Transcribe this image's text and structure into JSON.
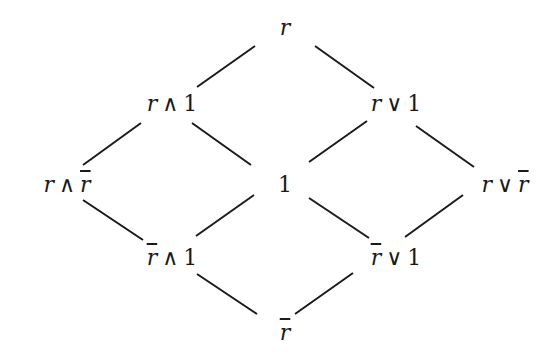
{
  "diagram": {
    "type": "hasse-lattice",
    "nodes": [
      {
        "id": "top",
        "label": "r",
        "parts": {
          "a": "r",
          "a_bar": false,
          "op": "",
          "b": "",
          "b_bar": false
        },
        "x": 285,
        "y": 28
      },
      {
        "id": "r_and_1",
        "label": "r ∧ 1",
        "parts": {
          "a": "r",
          "a_bar": false,
          "op": "∧",
          "b": "1",
          "b_bar": false
        },
        "x": 172,
        "y": 104
      },
      {
        "id": "r_or_1",
        "label": "r ∨ 1",
        "parts": {
          "a": "r",
          "a_bar": false,
          "op": "∨",
          "b": "1",
          "b_bar": false
        },
        "x": 396,
        "y": 104
      },
      {
        "id": "r_and_rbar",
        "label": "r ∧ r̄",
        "parts": {
          "a": "r",
          "a_bar": false,
          "op": "∧",
          "b": "r",
          "b_bar": true
        },
        "x": 67,
        "y": 185
      },
      {
        "id": "one",
        "label": "1",
        "parts": {
          "a": "1",
          "a_bar": false,
          "op": "",
          "b": "",
          "b_bar": false
        },
        "x": 285,
        "y": 185
      },
      {
        "id": "r_or_rbar",
        "label": "r ∨ r̄",
        "parts": {
          "a": "r",
          "a_bar": false,
          "op": "∨",
          "b": "r",
          "b_bar": true
        },
        "x": 505,
        "y": 185
      },
      {
        "id": "rbar_and_1",
        "label": "r̄ ∧ 1",
        "parts": {
          "a": "r",
          "a_bar": true,
          "op": "∧",
          "b": "1",
          "b_bar": false
        },
        "x": 172,
        "y": 258
      },
      {
        "id": "rbar_or_1",
        "label": "r̄ ∨ 1",
        "parts": {
          "a": "r",
          "a_bar": true,
          "op": "∨",
          "b": "1",
          "b_bar": false
        },
        "x": 396,
        "y": 258
      },
      {
        "id": "bottom",
        "label": "r̄",
        "parts": {
          "a": "r",
          "a_bar": true,
          "op": "",
          "b": "",
          "b_bar": false
        },
        "x": 285,
        "y": 333
      }
    ],
    "edges": [
      {
        "from": "top",
        "to": "r_and_1",
        "x1": 255,
        "y1": 46,
        "x2": 197,
        "y2": 87
      },
      {
        "from": "top",
        "to": "r_or_1",
        "x1": 315,
        "y1": 46,
        "x2": 374,
        "y2": 88
      },
      {
        "from": "r_and_1",
        "to": "r_and_rbar",
        "x1": 141,
        "y1": 123,
        "x2": 83,
        "y2": 165
      },
      {
        "from": "r_and_1",
        "to": "one",
        "x1": 192,
        "y1": 123,
        "x2": 251,
        "y2": 165
      },
      {
        "from": "r_or_1",
        "to": "one",
        "x1": 367,
        "y1": 121,
        "x2": 309,
        "y2": 162
      },
      {
        "from": "r_or_1",
        "to": "r_or_rbar",
        "x1": 416,
        "y1": 126,
        "x2": 474,
        "y2": 167
      },
      {
        "from": "r_and_rbar",
        "to": "rbar_and_1",
        "x1": 83,
        "y1": 200,
        "x2": 143,
        "y2": 240
      },
      {
        "from": "one",
        "to": "rbar_and_1",
        "x1": 254,
        "y1": 195,
        "x2": 196,
        "y2": 236
      },
      {
        "from": "one",
        "to": "rbar_or_1",
        "x1": 309,
        "y1": 198,
        "x2": 369,
        "y2": 238
      },
      {
        "from": "r_or_rbar",
        "to": "rbar_or_1",
        "x1": 463,
        "y1": 195,
        "x2": 405,
        "y2": 237
      },
      {
        "from": "rbar_and_1",
        "to": "bottom",
        "x1": 197,
        "y1": 274,
        "x2": 257,
        "y2": 314
      },
      {
        "from": "rbar_or_1",
        "to": "bottom",
        "x1": 353,
        "y1": 273,
        "x2": 295,
        "y2": 314
      }
    ],
    "colors": {
      "ink": "#1a1a1a",
      "background": "#ffffff"
    }
  }
}
